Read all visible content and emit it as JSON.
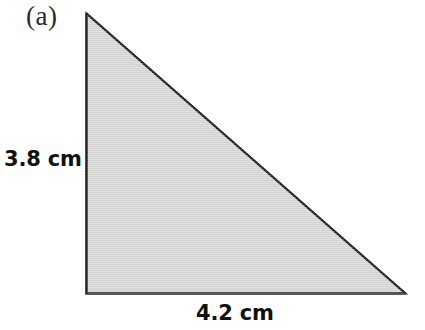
{
  "figure": {
    "name": "right-triangle-figure",
    "part_label": "(a)",
    "shape": "right triangle",
    "background_color": "#ffffff",
    "fill_color": "#d4d4d4",
    "stroke_color": "#232323",
    "stroke_width_px": 2
  },
  "labels": {
    "height": "3.8 cm",
    "base": "4.2 cm"
  },
  "geometry": {
    "apex": {
      "x": 86,
      "y": 13
    },
    "bottom_left": {
      "x": 86,
      "y": 293
    },
    "bottom_right": {
      "x": 405,
      "y": 293
    },
    "right_angle_at": "bottom-left",
    "height_cm": 3.8,
    "base_cm": 4.2
  }
}
